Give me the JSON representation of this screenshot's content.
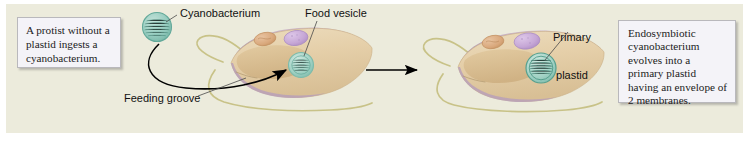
{
  "figure": {
    "background_color": "#ecebdc",
    "outer_color": "#ffffff"
  },
  "callouts": [
    {
      "id": "left",
      "text": "A protist without a plastid ingests a cyanobacterium.",
      "fill": "#f4f3f8",
      "border": "#b9b8bc"
    },
    {
      "id": "right",
      "text": "Endosymbiotic cyanobacterium evolves into a primary plastid having an envelope of 2 membranes.",
      "fill": "#f4f3f8",
      "border": "#b9b8bc"
    }
  ],
  "labels": {
    "cyanobacterium": "Cyanobacterium",
    "food_vesicle": "Food vesicle",
    "feeding_groove": "Feeding groove",
    "primary_plastid_line1": "Primary",
    "primary_plastid_line2": "plastid"
  },
  "colors": {
    "background": "#ecebdc",
    "cell_body": "#e3cda6",
    "cell_body_light": "#ead9bb",
    "cell_membrane": "#b9a0b8",
    "cell_membrane_dark": "#a98fa8",
    "flagellum": "#c6c083",
    "cyanobacterium": "#9ed0c4",
    "cyanobacterium_stroke": "#63a99a",
    "plastid": "#a6d6c9",
    "plastid_stroke": "#56a08f",
    "nucleus": "#c8a9d8",
    "nucleus_stroke": "#a98cc0",
    "mitochondrion": "#dba87c",
    "mitochondrion_stroke": "#c08c5e",
    "groove": "#d6bb90",
    "arrow": "#000000",
    "text": "#111111"
  },
  "stages": [
    {
      "name": "stage-1-ingestion",
      "description": "Protist with feeding groove engulfing a free-living cyanobacterium into a food vesicle",
      "organelles": [
        "mitochondrion",
        "nucleus",
        "food-vesicle"
      ]
    },
    {
      "name": "stage-2-primary-plastid",
      "description": "Protist in which the endosymbiotic cyanobacterium has become a primary plastid",
      "organelles": [
        "mitochondrion",
        "nucleus",
        "primary-plastid"
      ]
    }
  ],
  "arrows": {
    "ingestion_arrow": "curved arrow from free cyanobacterium into food vesicle",
    "transition_arrow": "straight arrow from first cell to second cell"
  }
}
